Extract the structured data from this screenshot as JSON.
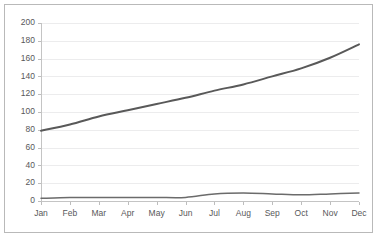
{
  "chart_data": {
    "type": "line",
    "title": "",
    "subtitle": "",
    "xlabel": "",
    "ylabel": "",
    "categories": [
      "Jan",
      "Feb",
      "Mar",
      "Apr",
      "May",
      "Jun",
      "Jul",
      "Aug",
      "Sep",
      "Oct",
      "Nov",
      "Dec"
    ],
    "ylim": [
      0,
      200
    ],
    "yticks": [
      0,
      20,
      40,
      60,
      80,
      100,
      120,
      140,
      160,
      180,
      200
    ],
    "ytick_labels": [
      "0",
      "20",
      "40",
      "60",
      "80",
      "100",
      "120",
      "140",
      "160",
      "180",
      "200"
    ],
    "grid": true,
    "grid_axis": "y",
    "legend": false,
    "legend_position": "none",
    "series": [
      {
        "name": "Series 1",
        "color": "#595959",
        "line_width": 2,
        "smooth": true,
        "values": [
          79,
          86,
          95,
          102,
          109,
          116,
          124,
          131,
          140,
          149,
          161,
          176
        ]
      },
      {
        "name": "Series 2",
        "color": "#6b6b6b",
        "line_width": 1.5,
        "smooth": true,
        "values": [
          3,
          4,
          4,
          4,
          4,
          4,
          8,
          9,
          8,
          7,
          8,
          9
        ]
      }
    ]
  },
  "axes": {
    "y_axis_name": "value-axis",
    "x_axis_name": "category-axis"
  },
  "frame": {
    "border_color": "#b9b9b9",
    "background": "#ffffff"
  }
}
